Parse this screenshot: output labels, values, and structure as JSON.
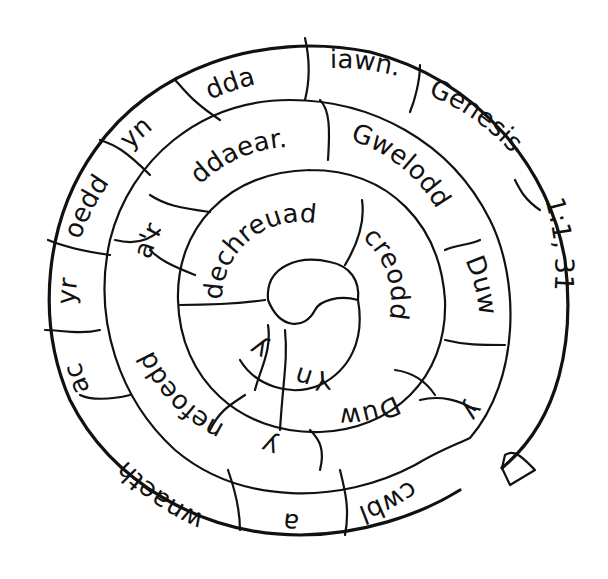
{
  "puzzle": {
    "type": "word-spiral",
    "reading_order": "from center outward",
    "sentence": "Yn y dechreuad creodd Duw y nefoedd a'r ddaear. Gwelodd Duw y cwbl a wnaeth ac yr oedd yn dda iawn.",
    "reference": "Genesis 1:1, 31",
    "rings": {
      "inner": [
        {
          "text": "Yn"
        },
        {
          "text": "y"
        },
        {
          "text": "dechreuad"
        },
        {
          "text": "creodd"
        },
        {
          "text": "Duw"
        },
        {
          "text": "y"
        }
      ],
      "middle": [
        {
          "text": "nefoedd"
        },
        {
          "text": "a'r"
        },
        {
          "text": "ddaear."
        },
        {
          "text": "Gwelodd"
        },
        {
          "text": "Duw"
        },
        {
          "text": "y"
        }
      ],
      "outer": [
        {
          "text": "cwbl"
        },
        {
          "text": "a"
        },
        {
          "text": "wnaeth"
        },
        {
          "text": "ac"
        },
        {
          "text": "yr"
        },
        {
          "text": "oedd"
        },
        {
          "text": "yn"
        },
        {
          "text": "dda"
        },
        {
          "text": "iawn."
        },
        {
          "text": "Genesis"
        },
        {
          "text": "1:1, 31"
        }
      ]
    },
    "colors": {
      "line": "#111111",
      "background": "#ffffff"
    }
  }
}
